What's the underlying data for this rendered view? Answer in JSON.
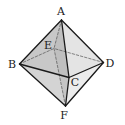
{
  "figure": {
    "type": "octahedron",
    "vertices": {
      "A": {
        "label": "A",
        "x": 61.5,
        "y": 20
      },
      "B": {
        "label": "B",
        "x": 19.5,
        "y": 64
      },
      "C": {
        "label": "C",
        "x": 69,
        "y": 77.5
      },
      "D": {
        "label": "D",
        "x": 103.5,
        "y": 62.5
      },
      "E": {
        "label": "E",
        "x": 54,
        "y": 48.5
      },
      "F": {
        "label": "F",
        "x": 65.5,
        "y": 106
      }
    },
    "labels": [
      {
        "text": "A",
        "x": 61,
        "y": 15
      },
      {
        "text": "E",
        "x": 48,
        "y": 49
      },
      {
        "text": "B",
        "x": 12,
        "y": 68
      },
      {
        "text": "D",
        "x": 110,
        "y": 67
      },
      {
        "text": "C",
        "x": 75,
        "y": 86
      },
      {
        "text": "F",
        "x": 64,
        "y": 119
      }
    ],
    "solid_edges": [
      "AB",
      "AC",
      "AD",
      "BC",
      "CD",
      "BF",
      "CF",
      "DF"
    ],
    "dashed_edges": [
      "AE",
      "BE",
      "DE",
      "EF"
    ],
    "colors": {
      "edge": "#1a1a1a",
      "dashed": "#555555",
      "face_ABC": "#c8c8c8",
      "face_ACD": "#e4e4e4",
      "face_BCF": "#d4d4d4",
      "face_CDF": "#ececec",
      "inner_AEF": "#b4b4b4"
    }
  }
}
